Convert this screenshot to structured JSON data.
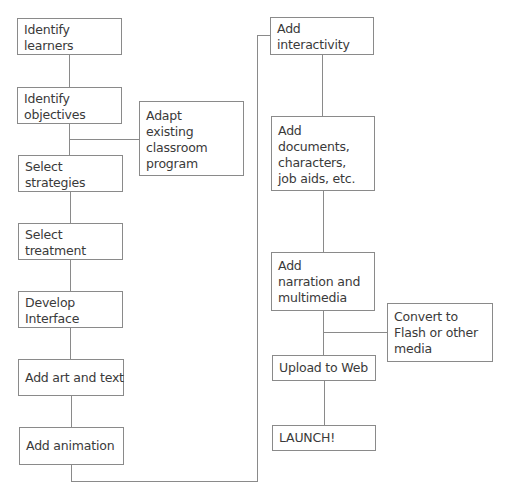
{
  "diagram": {
    "left_column": [
      {
        "id": "identify-learners",
        "lines": [
          "Identify",
          "learners"
        ]
      },
      {
        "id": "identify-objectives",
        "lines": [
          "Identify",
          "objectives"
        ]
      },
      {
        "id": "select-strategies",
        "lines": [
          "Select",
          "strategies"
        ]
      },
      {
        "id": "select-treatment",
        "lines": [
          "Select",
          "treatment"
        ]
      },
      {
        "id": "develop-interface",
        "lines": [
          "Develop",
          "Interface"
        ]
      },
      {
        "id": "add-art-and-text",
        "lines": [
          "Add art and text"
        ]
      },
      {
        "id": "add-animation",
        "lines": [
          "Add animation"
        ]
      }
    ],
    "left_side_branch": {
      "id": "adapt-existing-classroom-program",
      "lines": [
        "Adapt",
        "existing",
        "classroom",
        "program"
      ]
    },
    "right_column": [
      {
        "id": "add-interactivity",
        "lines": [
          "Add",
          "interactivity"
        ]
      },
      {
        "id": "add-documents",
        "lines": [
          "Add",
          "documents,",
          "characters,",
          "job aids, etc."
        ]
      },
      {
        "id": "add-narration",
        "lines": [
          "Add",
          "narration and",
          "multimedia"
        ]
      },
      {
        "id": "upload-to-web",
        "lines": [
          "Upload to Web"
        ]
      },
      {
        "id": "launch",
        "lines": [
          "LAUNCH!"
        ]
      }
    ],
    "right_side_branch": {
      "id": "convert-to-flash",
      "lines": [
        "Convert to",
        "Flash or other",
        "media"
      ]
    },
    "colors": {
      "line": "#8a8a8a",
      "text": "#3a3a3a",
      "background": "#ffffff"
    }
  }
}
